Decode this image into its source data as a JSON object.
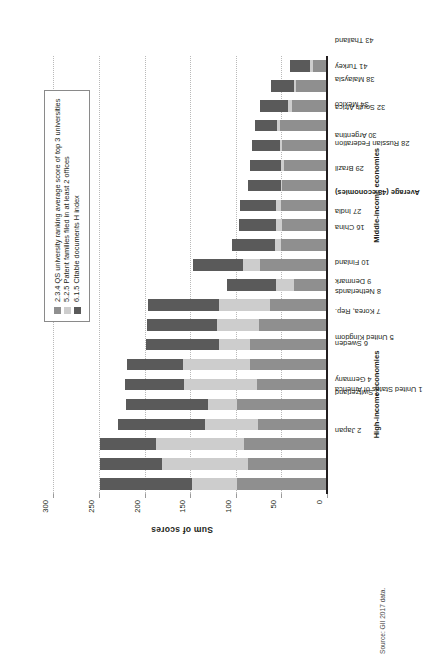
{
  "figure": {
    "source_note": "Source: GII 2017 data."
  },
  "legend": {
    "items": [
      {
        "label": "2.3.4 QS university ranking average score of top 3 universities",
        "color": "#8f8f8f",
        "key": "s1"
      },
      {
        "label": "5.2.5 Patent families filed in at least 2 offices",
        "color": "#cdcdcd",
        "key": "s2"
      },
      {
        "label": "6.1.5 Citable documents H index",
        "color": "#5a5a5a",
        "key": "s3"
      }
    ]
  },
  "groups": [
    {
      "label": "High-income economies",
      "start": 0,
      "end": 9
    },
    {
      "label": "Middle-income economies",
      "start": 10,
      "end": 19
    }
  ],
  "chart_data": {
    "type": "bar",
    "title": "",
    "subtitle": "",
    "xlabel": "",
    "ylabel": "Sum of scores",
    "orientation": "vertical-rotated",
    "stacked": true,
    "grid": true,
    "legend_position": "inside-right",
    "ylim": [
      0,
      320
    ],
    "yticks": [
      0,
      50,
      100,
      150,
      200,
      250,
      300
    ],
    "ytick_labels": [
      "0",
      "50",
      "100",
      "150",
      "200",
      "250",
      "300"
    ],
    "categories": [
      "1 United States of America",
      "2 Japan",
      "3 Switzerland",
      "4 Germany",
      "5 United Kingdom",
      "6 Sweden",
      "7 Korea, Rep.",
      "8 Netherlands",
      "9 Denmark",
      "10 Finland",
      "Average (48 economies)",
      "16 China",
      "27 India",
      "28 Russian Federation",
      "29 Brazil",
      "30 Argentina",
      "32 South Africa",
      "34 Mexico",
      "38 Malaysia",
      "41 Turkey",
      "43 Thailand",
      "Average (62 economies)"
    ],
    "series": [
      {
        "name": "2.3.4 QS university ranking average score of top 3 universities",
        "color": "#8f8f8f",
        "values": [
          100,
          88,
          92,
          77,
          100,
          78,
          86,
          86,
          76,
          64,
          37,
          75,
          52,
          50,
          52,
          50,
          48,
          50,
          53,
          40,
          35,
          16
        ]
      },
      {
        "name": "5.2.5 Patent families filed in at least 2 offices",
        "color": "#cdcdcd",
        "values": [
          49,
          94,
          96,
          58,
          31,
          80,
          73,
          34,
          46,
          55,
          20,
          18,
          6,
          7,
          5,
          2,
          4,
          3,
          3,
          4,
          2,
          4
        ]
      },
      {
        "name": "6.1.5 Citable documents H index",
        "color": "#5a5a5a",
        "values": [
          101,
          68,
          62,
          95,
          90,
          64,
          61,
          80,
          76,
          78,
          54,
          55,
          47,
          41,
          39,
          36,
          33,
          30,
          24,
          31,
          26,
          22
        ]
      }
    ],
    "totals": [
      250,
      250,
      250,
      230,
      221,
      222,
      220,
      200,
      198,
      197,
      111,
      148,
      105,
      98,
      96,
      88,
      85,
      83,
      80,
      75,
      63,
      42
    ]
  }
}
